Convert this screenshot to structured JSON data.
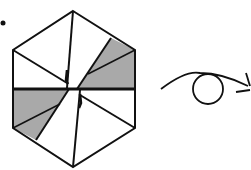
{
  "figure": {
    "background": "#ffffff",
    "stroke_color": "#111111",
    "shade_color": "#a9a9a9",
    "bullet": {
      "label": "bullet-dot"
    },
    "hexagon": {
      "vertices": [
        [
          73,
          11
        ],
        [
          135,
          50
        ],
        [
          135,
          128
        ],
        [
          73,
          167
        ],
        [
          13,
          128
        ],
        [
          13,
          50
        ]
      ],
      "center": [
        73,
        89
      ],
      "shaded_regions": 2
    },
    "eye": {
      "description": "eye viewing direction with arrow pointing right"
    }
  }
}
